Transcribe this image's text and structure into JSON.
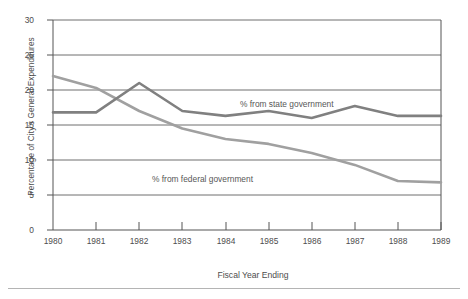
{
  "chart_data": {
    "type": "line",
    "title": "",
    "xlabel": "Fiscal Year Ending",
    "ylabel": "Percentage of City's General Expenditures",
    "x": [
      1980,
      1981,
      1982,
      1983,
      1984,
      1985,
      1986,
      1987,
      1988,
      1989
    ],
    "categories": [
      "1980",
      "1981",
      "1982",
      "1983",
      "1984",
      "1985",
      "1986",
      "1987",
      "1988",
      "1989"
    ],
    "xlim": [
      1980,
      1989
    ],
    "ylim": [
      0,
      30
    ],
    "yticks": [
      0,
      5,
      10,
      15,
      20,
      25,
      30
    ],
    "ytick_labels": [
      "0",
      "5",
      "10",
      "15",
      "20",
      "25",
      "30"
    ],
    "grid": "horizontal",
    "legend_position": "inline-annotation",
    "series": [
      {
        "name": "% from state government",
        "color": "#808080",
        "values": [
          16.8,
          16.8,
          21.0,
          17.0,
          16.3,
          17.0,
          16.0,
          17.7,
          16.3,
          16.3
        ]
      },
      {
        "name": "% from federal government",
        "color": "#a0a0a0",
        "values": [
          22.0,
          20.3,
          17.0,
          14.5,
          13.0,
          12.3,
          11.0,
          9.3,
          7.0,
          6.8
        ]
      }
    ],
    "annotations": [
      {
        "text": "% from state government",
        "x": 1984.4,
        "y": 18.6
      },
      {
        "text": "% from federal government",
        "x": 1982.3,
        "y": 8.4
      }
    ]
  },
  "axis": {
    "y_title": "Percentage of City's General Expenditures",
    "x_title": "Fiscal Year Ending"
  },
  "colors": {
    "state_line": "#808080",
    "federal_line": "#a0a0a0",
    "grid": "#6e6e6e",
    "axis": "#555555",
    "text": "#4d4d4d",
    "rule": "#b4b4b4"
  }
}
